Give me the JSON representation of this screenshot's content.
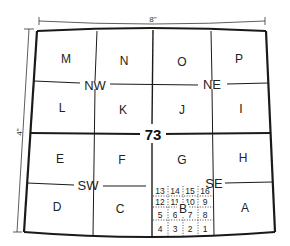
{
  "diagram": {
    "dimensions": {
      "width_label": "8\"",
      "height_label": "4\""
    },
    "center_label": "73",
    "quadrants": {
      "nw": "NW",
      "ne": "NE",
      "sw": "SW",
      "se": "SE"
    },
    "cells": {
      "row1": [
        "M",
        "N",
        "O",
        "P"
      ],
      "row2": [
        "L",
        "K",
        "J",
        "I"
      ],
      "row3": [
        "E",
        "F",
        "G",
        "H"
      ],
      "row4": [
        "D",
        "C",
        "B",
        "A"
      ]
    },
    "subgrid": {
      "parent_cell": "B",
      "rows": [
        [
          "13",
          "14",
          "15",
          "16"
        ],
        [
          "12",
          "11",
          "10",
          "9"
        ],
        [
          "5",
          "6",
          "7",
          "8"
        ],
        [
          "4",
          "3",
          "2",
          "1"
        ]
      ]
    },
    "colors": {
      "line": "#1a1a1a",
      "background": "#ffffff"
    }
  }
}
